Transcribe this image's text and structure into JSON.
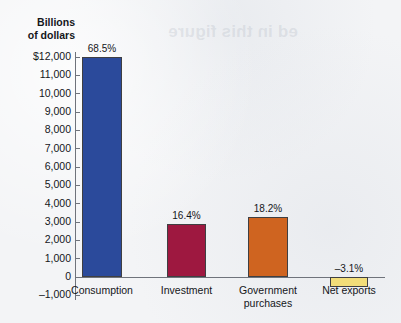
{
  "background_note": "scanned textbook page, faint reverse-side bleed-through above chart",
  "bleed_through_text": "ed in this figure",
  "chart_data": {
    "type": "bar",
    "title": "",
    "ylabel": "Billions\nof dollars",
    "xlabel": "",
    "ylim": [
      -1000,
      12000
    ],
    "grid": false,
    "legend": "none",
    "categories": [
      "Consumption",
      "Investment",
      "Government\npurchases",
      "Net exports"
    ],
    "values": [
      12000,
      2900,
      3250,
      -550
    ],
    "data_labels": [
      "68.5%",
      "16.4%",
      "18.2%",
      "–3.1%"
    ],
    "colors": [
      "#2b4a9b",
      "#9e1840",
      "#cf6420",
      "#f2dd79"
    ],
    "ytick_labels": [
      "$12,000",
      "11,000",
      "10,000",
      "9,000",
      "8,000",
      "7,000",
      "6,000",
      "5,000",
      "4,000",
      "3,000",
      "2,000",
      "1,000",
      "0",
      "–1,000"
    ],
    "ytick_values": [
      12000,
      11000,
      10000,
      9000,
      8000,
      7000,
      6000,
      5000,
      4000,
      3000,
      2000,
      1000,
      0,
      -1000
    ]
  },
  "axis": {
    "title_line1": "Billions",
    "title_line2": "of dollars",
    "axis_color": "#6f737b"
  }
}
